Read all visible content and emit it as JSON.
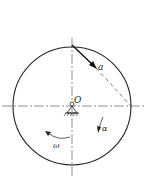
{
  "diagram": {
    "labels": {
      "center": "O",
      "acceleration": "a",
      "angular_velocity": "ω",
      "angular_acceleration": "α"
    },
    "colors": {
      "line": "#222222",
      "background": "#ffffff"
    }
  }
}
